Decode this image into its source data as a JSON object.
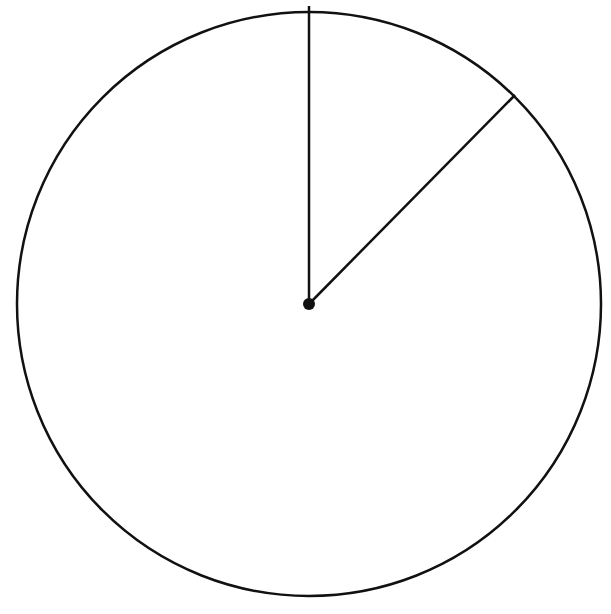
{
  "diagram": {
    "type": "circle-with-radii",
    "colors": {
      "stroke": "#111111",
      "background": "#ffffff"
    },
    "circle": {
      "cx": 309,
      "cy": 304,
      "r": 292,
      "stroke_width": 2.5
    },
    "center_point": {
      "cx": 309,
      "cy": 304,
      "r": 6
    },
    "radii": [
      {
        "id": "vertical",
        "x2": 309,
        "y2": 6
      },
      {
        "id": "diagonal",
        "x2": 515,
        "y2": 95
      }
    ]
  }
}
